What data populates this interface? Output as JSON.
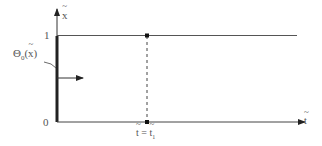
{
  "diagram": {
    "y_axis_label": "x",
    "x_axis_label": "t",
    "y_tick_top": "1",
    "y_tick_bottom": "0",
    "boundary_label_main": "Θ",
    "boundary_label_sub": "0",
    "boundary_label_arg": "(x)",
    "vertical_marker_lhs": "t",
    "vertical_marker_eq": "=",
    "vertical_marker_rhs": "t",
    "vertical_marker_rhs_sub": "1",
    "colors": {
      "axis": "#333333",
      "line": "#555555",
      "text": "#555555"
    }
  }
}
